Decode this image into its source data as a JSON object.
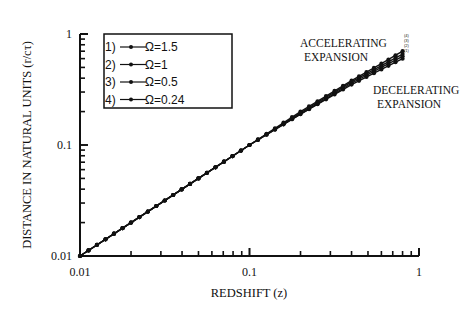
{
  "chart_data": {
    "type": "line",
    "title": "",
    "xlabel": "REDSHIFT (z)",
    "ylabel": "DISTANCE IN NATURAL UNITS (r/cτ)",
    "xscale": "log",
    "yscale": "log",
    "xlim": [
      0.01,
      1
    ],
    "ylim": [
      0.01,
      1
    ],
    "xticks": [
      "0.01",
      "0.1",
      "1"
    ],
    "yticks": [
      "0.01",
      "0.1",
      "1"
    ],
    "grid": false,
    "legend_position": "upper-left",
    "legend": [
      {
        "label": "1)",
        "omega": "Ω=1.5"
      },
      {
        "label": "2)",
        "omega": "Ω=1"
      },
      {
        "label": "3)",
        "omega": "Ω=0.5"
      },
      {
        "label": "4)",
        "omega": "Ω=0.24"
      }
    ],
    "annotations": [
      {
        "text": [
          "ACCELERATING",
          "EXPANSION"
        ],
        "position": "upper-right above curve"
      },
      {
        "text": [
          "DECELERATING",
          "EXPANSION"
        ],
        "position": "right below curve"
      },
      {
        "text": [
          "(4)",
          "(3)",
          "(2)",
          "(1)"
        ],
        "position": "curve ends"
      }
    ],
    "series": [
      {
        "name": "Ω=1.5",
        "x": [
          0.01,
          0.02,
          0.05,
          0.1,
          0.2,
          0.4,
          0.6,
          0.8
        ],
        "y": [
          0.01,
          0.02,
          0.05,
          0.1,
          0.19,
          0.35,
          0.48,
          0.6
        ]
      },
      {
        "name": "Ω=1",
        "x": [
          0.01,
          0.02,
          0.05,
          0.1,
          0.2,
          0.4,
          0.6,
          0.8
        ],
        "y": [
          0.01,
          0.02,
          0.05,
          0.1,
          0.19,
          0.36,
          0.5,
          0.63
        ]
      },
      {
        "name": "Ω=0.5",
        "x": [
          0.01,
          0.02,
          0.05,
          0.1,
          0.2,
          0.4,
          0.6,
          0.8
        ],
        "y": [
          0.01,
          0.02,
          0.05,
          0.1,
          0.195,
          0.37,
          0.52,
          0.66
        ]
      },
      {
        "name": "Ω=0.24",
        "x": [
          0.01,
          0.02,
          0.05,
          0.1,
          0.2,
          0.4,
          0.6,
          0.8
        ],
        "y": [
          0.01,
          0.02,
          0.05,
          0.1,
          0.2,
          0.38,
          0.54,
          0.7
        ]
      }
    ]
  },
  "layout": {
    "plot": {
      "left": 80,
      "right": 419,
      "top": 34,
      "bottom": 256
    },
    "line_color": "#111111"
  }
}
